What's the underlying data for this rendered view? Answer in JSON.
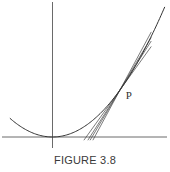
{
  "chart_data": {
    "type": "line",
    "title": "",
    "caption": "FIGURE 3.8",
    "curve": {
      "name": "parabola",
      "function": "y = x^2",
      "x_range": [
        -0.38,
        1.0
      ]
    },
    "axes": {
      "x_axis": true,
      "y_axis": true,
      "ticks": false,
      "xlabel": "",
      "ylabel": ""
    },
    "point": {
      "label": "P",
      "x": 0.6
    },
    "secant_points_x": [
      0.75,
      0.85,
      1.0
    ],
    "tangent_at_point": true,
    "xlim": [
      -0.45,
      1.02
    ],
    "ylim": [
      -0.03,
      1.03
    ]
  },
  "caption": "FIGURE 3.8"
}
